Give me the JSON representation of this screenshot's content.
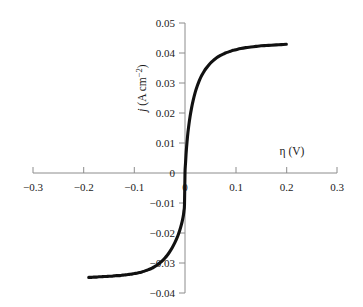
{
  "chart_data": {
    "type": "line",
    "title": "",
    "subtitle": "",
    "xlabel": "η (V)",
    "ylabel": "j (A cm−2)",
    "ylabel_parts": {
      "symbol": "j",
      "units": "(A cm",
      "exponent": "−2",
      "units_close": ")"
    },
    "xlim": [
      -0.3,
      0.3
    ],
    "ylim": [
      -0.04,
      0.05
    ],
    "grid": false,
    "legend": null,
    "legend_position": "none",
    "xticks": [
      -0.3,
      -0.2,
      -0.1,
      0,
      0.1,
      0.2,
      0.3
    ],
    "xtick_labels": [
      "−0.3",
      "−0.2",
      "−0.1",
      "0",
      "0.1",
      "0.2",
      "0.3"
    ],
    "yticks": [
      0.05,
      0.04,
      0.03,
      0.02,
      0.01,
      0,
      -0.01,
      -0.02,
      -0.03,
      -0.04
    ],
    "ytick_labels": [
      "0.05",
      "0.04",
      "0.03",
      "0.02",
      "0.01",
      "0",
      "−0.01",
      "−0.02",
      "−0.03",
      "−0.04"
    ],
    "axes_style": "crossed-at-origin",
    "series": [
      {
        "name": "polarization curve",
        "color": "#111111",
        "x": [
          -0.19,
          -0.185,
          -0.18,
          -0.175,
          -0.17,
          -0.165,
          -0.16,
          -0.155,
          -0.15,
          -0.145,
          -0.14,
          -0.135,
          -0.13,
          -0.125,
          -0.12,
          -0.115,
          -0.11,
          -0.105,
          -0.1,
          -0.095,
          -0.09,
          -0.085,
          -0.08,
          -0.075,
          -0.07,
          -0.065,
          -0.06,
          -0.055,
          -0.05,
          -0.045,
          -0.04,
          -0.035,
          -0.03,
          -0.025,
          -0.02,
          -0.016,
          -0.013,
          -0.01,
          -0.007,
          -0.005,
          -0.003,
          -0.002,
          -0.001,
          0.0,
          0.001,
          0.002,
          0.003,
          0.005,
          0.007,
          0.01,
          0.013,
          0.016,
          0.02,
          0.024,
          0.028,
          0.032,
          0.036,
          0.04,
          0.045,
          0.05,
          0.055,
          0.06,
          0.065,
          0.07,
          0.075,
          0.08,
          0.085,
          0.09,
          0.095,
          0.1,
          0.11,
          0.12,
          0.13,
          0.14,
          0.15,
          0.16,
          0.17,
          0.18,
          0.19,
          0.2
        ],
        "y": [
          -0.0348,
          -0.0348,
          -0.0347,
          -0.0347,
          -0.0346,
          -0.0346,
          -0.0345,
          -0.0345,
          -0.0344,
          -0.0344,
          -0.0343,
          -0.0342,
          -0.0342,
          -0.0341,
          -0.034,
          -0.0339,
          -0.0338,
          -0.0337,
          -0.0335,
          -0.0334,
          -0.0332,
          -0.033,
          -0.0327,
          -0.0324,
          -0.0321,
          -0.0317,
          -0.0312,
          -0.0307,
          -0.03,
          -0.0293,
          -0.0284,
          -0.0274,
          -0.0262,
          -0.0248,
          -0.0232,
          -0.0217,
          -0.0204,
          -0.0189,
          -0.0171,
          -0.0157,
          -0.0139,
          -0.0125,
          -0.0105,
          -0.0,
          0.0032,
          0.006,
          0.0084,
          0.0122,
          0.0152,
          0.0188,
          0.0217,
          0.0241,
          0.0268,
          0.0289,
          0.0307,
          0.0322,
          0.0334,
          0.0345,
          0.0356,
          0.0366,
          0.0374,
          0.0381,
          0.0387,
          0.0392,
          0.0396,
          0.04,
          0.0403,
          0.0406,
          0.0409,
          0.0411,
          0.0415,
          0.0418,
          0.042,
          0.0422,
          0.0424,
          0.0425,
          0.0426,
          0.0427,
          0.0428,
          0.0429
        ]
      }
    ]
  }
}
